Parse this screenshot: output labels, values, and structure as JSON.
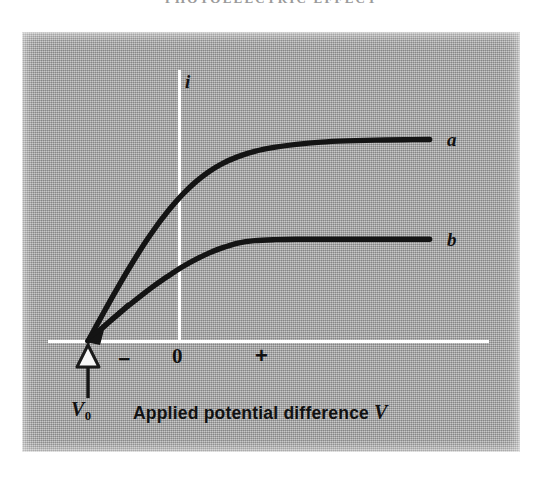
{
  "page": {
    "running_head": "PHOTOELECTRIC EFFECT"
  },
  "figure": {
    "background_color": "#a9a9a9",
    "axis_color": "#ffffff",
    "curve_color": "#111111",
    "vertical_axis_label": "i",
    "horizontal_axis_caption": "Applied potential difference",
    "horizontal_axis_variable": "V",
    "tick_minus": "−",
    "tick_zero": "0",
    "tick_plus": "+",
    "stopping_potential_label": "V",
    "stopping_potential_subscript": "0",
    "curve_a_label": "a",
    "curve_b_label": "b",
    "marker": "hollow-triangle"
  },
  "chart_data": {
    "type": "line",
    "title": "",
    "xlabel": "Applied potential difference V",
    "ylabel": "i",
    "xlim": [
      -1.0,
      3.2
    ],
    "ylim": [
      0,
      1.15
    ],
    "grid": false,
    "legend_position": "right-of-curve-ends",
    "annotations": [
      {
        "text": "V0",
        "x": -1.0,
        "y": 0,
        "note": "stopping potential, hollow triangle marker on x-axis"
      },
      {
        "text": "−",
        "x": -0.6,
        "y": -0.07
      },
      {
        "text": "0",
        "x": 0.0,
        "y": -0.07
      },
      {
        "text": "+",
        "x": 0.72,
        "y": -0.07
      }
    ],
    "series": [
      {
        "name": "a",
        "label": "a",
        "saturation_current": 1.0,
        "x": [
          -1.0,
          -0.9,
          -0.8,
          -0.7,
          -0.6,
          -0.5,
          -0.4,
          -0.3,
          -0.2,
          -0.1,
          0.0,
          0.15,
          0.3,
          0.45,
          0.6,
          0.8,
          1.0,
          1.25,
          1.5,
          1.8,
          2.1,
          2.45,
          2.8,
          3.1
        ],
        "values": [
          0.0,
          0.075,
          0.15,
          0.224,
          0.296,
          0.366,
          0.433,
          0.497,
          0.557,
          0.613,
          0.665,
          0.734,
          0.792,
          0.84,
          0.878,
          0.915,
          0.941,
          0.962,
          0.976,
          0.987,
          0.993,
          0.997,
          0.999,
          1.0
        ]
      },
      {
        "name": "b",
        "label": "b",
        "saturation_current": 0.505,
        "x": [
          -1.0,
          -0.9,
          -0.8,
          -0.7,
          -0.6,
          -0.5,
          -0.4,
          -0.3,
          -0.2,
          -0.1,
          0.0,
          0.15,
          0.3,
          0.45,
          0.6,
          0.8,
          1.0,
          1.25,
          1.5,
          1.8,
          2.1,
          2.45,
          2.8,
          3.1
        ],
        "values": [
          0.0,
          0.038,
          0.075,
          0.111,
          0.146,
          0.18,
          0.213,
          0.245,
          0.276,
          0.305,
          0.333,
          0.372,
          0.406,
          0.436,
          0.461,
          0.486,
          0.498,
          0.503,
          0.505,
          0.505,
          0.505,
          0.505,
          0.505,
          0.505
        ]
      }
    ]
  }
}
